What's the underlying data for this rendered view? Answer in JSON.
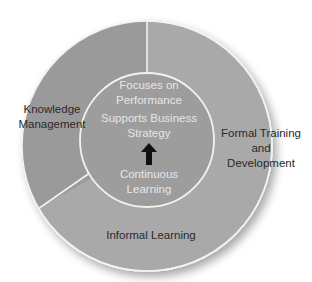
{
  "diagram": {
    "type": "ring-diagram",
    "colors": {
      "background": "#ffffff",
      "ring_light": "#a9a9a9",
      "ring_dark": "#9a9a9a",
      "inner_circle": "#9d9d9d",
      "divider": "#f2f2f2",
      "outer_label_text": "#2a2a2a",
      "inner_label_text": "#e6e6e6",
      "arrow": "#111111"
    },
    "outer_segments": [
      {
        "label_lines": [
          "Knowledge",
          "Management"
        ]
      },
      {
        "label_lines": [
          "Formal Training",
          "and",
          "Development"
        ]
      },
      {
        "label_lines": [
          "Informal Learning"
        ]
      }
    ],
    "center": {
      "top_lines": [
        "Focuses on",
        "Performance"
      ],
      "middle_lines": [
        "Supports Business",
        "Strategy"
      ],
      "bottom_lines": [
        "Continuous",
        "Learning"
      ],
      "arrow": "up-arrow-icon"
    }
  }
}
